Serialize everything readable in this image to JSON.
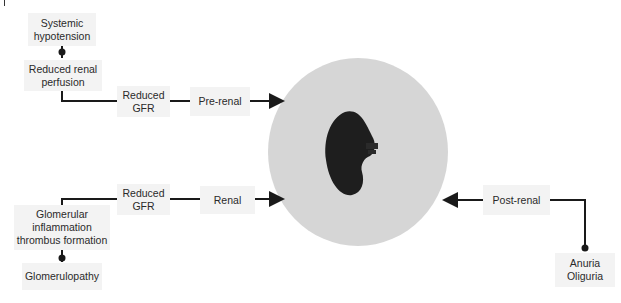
{
  "diagram": {
    "center": {
      "label": "kidney",
      "icon": "kidney-icon",
      "circle_color": "#d6d6d6",
      "kidney_color": "#1e1e1e"
    },
    "prerenal": {
      "cause": "Systemic\nhypotension",
      "effect": "Reduced renal\nperfusion",
      "gfr": "Reduced\nGFR",
      "category": "Pre-renal"
    },
    "renal": {
      "cause": "Glomerulopathy",
      "effect": "Glomerular\ninflammation\nthrombus formation",
      "gfr": "Reduced\nGFR",
      "category": "Renal"
    },
    "postrenal": {
      "category": "Post-renal",
      "effect": "Anuria\nOliguria"
    },
    "box_color": "#f3f3f3",
    "line_color": "#1a1a1a"
  }
}
